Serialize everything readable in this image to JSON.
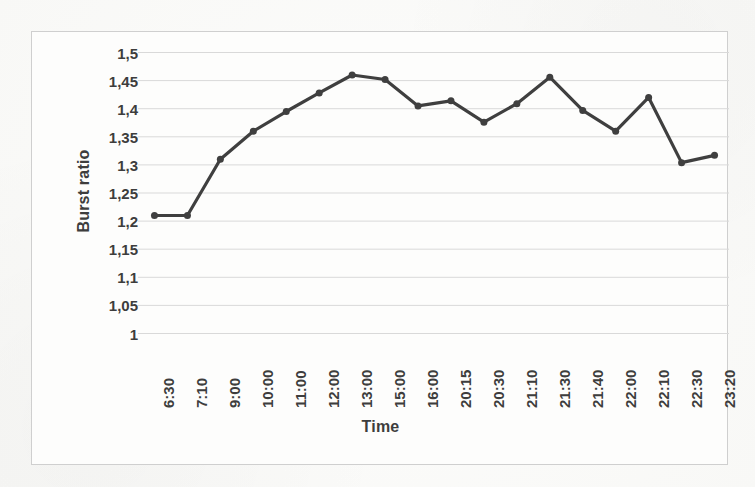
{
  "chart_data": {
    "type": "line",
    "title": "",
    "xlabel": "Time",
    "ylabel": "Burst ratio",
    "categories": [
      "6:30",
      "7:10",
      "9:00",
      "10:00",
      "11:00",
      "12:00",
      "13:00",
      "15:00",
      "16:00",
      "20:15",
      "20:30",
      "21:10",
      "21:30",
      "21:40",
      "22:00",
      "22:10",
      "22:30",
      "23:20"
    ],
    "values": [
      1.21,
      1.21,
      1.31,
      1.36,
      1.395,
      1.428,
      1.46,
      1.452,
      1.405,
      1.414,
      1.376,
      1.409,
      1.456,
      1.397,
      1.36,
      1.42,
      1.304,
      1.317
    ],
    "ytick_labels": [
      "1,5",
      "1,45",
      "1,4",
      "1,35",
      "1,3",
      "1,25",
      "1,2",
      "1,15",
      "1,1",
      "1,05",
      "1"
    ],
    "ytick_values": [
      1.5,
      1.45,
      1.4,
      1.35,
      1.3,
      1.25,
      1.2,
      1.15,
      1.1,
      1.05,
      1.0
    ],
    "ylim": [
      1.0,
      1.5
    ],
    "grid": true,
    "grid_axis": "y",
    "legend": "none",
    "series_color": "#3f3f3f",
    "grid_color": "#d9d9d9",
    "marker": "circle",
    "marker_size": 7
  },
  "figure": {
    "border_color": "#cfcfcf",
    "background_color": "#fdfdfc",
    "page_background": "#fbfbf9",
    "text_color": "#3d3d3d"
  }
}
